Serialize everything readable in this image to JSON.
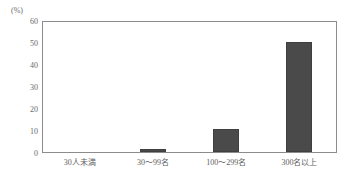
{
  "chart_data": {
    "type": "bar",
    "title": "",
    "subtitle": "",
    "xlabel": "",
    "ylabel": "",
    "unit_label": "(%)",
    "categories": [
      "30人未満",
      "30～99名",
      "100～299名",
      "300名以上"
    ],
    "values": [
      0,
      1.5,
      10.5,
      51
    ],
    "ylim": [
      0,
      60
    ],
    "yticks": [
      60,
      50,
      40,
      30,
      20,
      10,
      0
    ],
    "ytick_labels": [
      "60",
      "50",
      "40",
      "30",
      "20",
      "10",
      "0"
    ],
    "grid": false,
    "legend": false,
    "bar_color": "#4a4a4a",
    "frame_color": "#8c8c8c",
    "background_color": "#ffffff",
    "text_color": "#5e5e5e"
  }
}
